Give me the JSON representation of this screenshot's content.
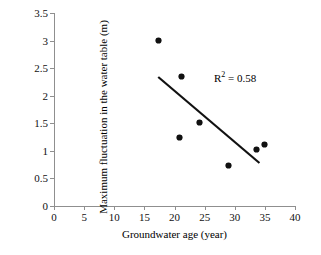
{
  "chart_data": {
    "type": "scatter",
    "title": "",
    "xlabel": "Groundwater age (year)",
    "ylabel": "Maximum fluctuation in the water table (m)",
    "xlim": [
      0,
      40
    ],
    "ylim": [
      0,
      3.5
    ],
    "xticks": [
      0,
      5,
      10,
      15,
      20,
      25,
      30,
      35,
      40
    ],
    "yticks": [
      0,
      0.5,
      1,
      1.5,
      2,
      2.5,
      3,
      3.5
    ],
    "xtick_labels": [
      "0",
      "5",
      "10",
      "15",
      "20",
      "25",
      "30",
      "35",
      "40"
    ],
    "ytick_labels": [
      "0",
      "0.5",
      "1",
      "1.5",
      "2",
      "2.5",
      "3",
      "3.5"
    ],
    "grid": false,
    "legend": null,
    "marker": "filled-circle",
    "marker_color": "#111111",
    "points": [
      {
        "x": 17.4,
        "y": 3.0
      },
      {
        "x": 21.1,
        "y": 2.34
      },
      {
        "x": 20.9,
        "y": 1.25
      },
      {
        "x": 24.1,
        "y": 1.51
      },
      {
        "x": 28.9,
        "y": 0.73
      },
      {
        "x": 33.6,
        "y": 1.03
      },
      {
        "x": 34.9,
        "y": 1.11
      }
    ],
    "trendline": {
      "type": "linear",
      "x_start": 17.3,
      "y_start": 2.34,
      "x_end": 34.1,
      "y_end": 0.78,
      "color": "#111111",
      "width": 2.2
    },
    "annotations": [
      {
        "name": "r-squared",
        "prefix": "R",
        "superscript": "2",
        "suffix": " = 0.58",
        "x": 27.5,
        "y": 2.45
      }
    ]
  },
  "annotation": {
    "r_prefix": "R",
    "r_superscript": "2",
    "r_value": " = 0.58"
  }
}
